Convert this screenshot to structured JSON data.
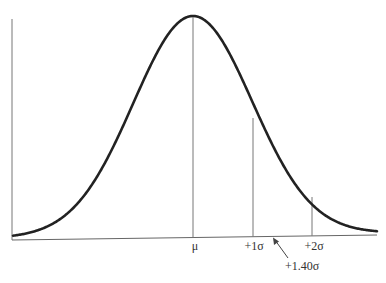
{
  "chart_data": {
    "type": "line",
    "title": "",
    "xlabel": "",
    "ylabel": "",
    "grid": false,
    "legend": null,
    "x_range_sigma": [
      -3.2,
      3.2
    ],
    "markers": [
      {
        "id": "mu",
        "label": "μ",
        "sigma": 0
      },
      {
        "id": "plus1",
        "label": "+1σ",
        "sigma": 1
      },
      {
        "id": "plus2",
        "label": "+2σ",
        "sigma": 2
      }
    ],
    "annotation": {
      "label": "+1.40σ",
      "sigma": 1.4,
      "style": "arrow"
    }
  },
  "labels": {
    "mu": "μ",
    "plus1": "+1σ",
    "plus2": "+2σ",
    "annotation": "+1.40σ"
  },
  "colors": {
    "curve": "#222222",
    "axis": "#666666",
    "marker": "#777777",
    "text": "#333333"
  }
}
